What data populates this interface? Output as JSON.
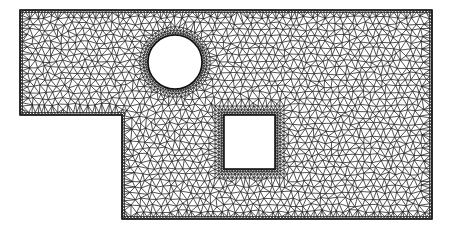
{
  "figure": {
    "type": "triangular finite element mesh",
    "width": 450,
    "height": 231,
    "colors": {
      "background": "#ffffff",
      "mesh_line": "#1a1a1a",
      "domain_fill": "#ffffff",
      "hole_fill": "#ffffff"
    },
    "domain": {
      "outline": [
        [
          20,
          10
        ],
        [
          432,
          10
        ],
        [
          432,
          219
        ],
        [
          122,
          219
        ],
        [
          122,
          115
        ],
        [
          20,
          115
        ]
      ]
    },
    "holes": [
      {
        "kind": "circle",
        "cx": 175,
        "cy": 62,
        "r": 27
      },
      {
        "kind": "square",
        "x": 224,
        "y": 115,
        "w": 51,
        "h": 54
      }
    ],
    "mesh": {
      "base_spacing": 7.2,
      "boundary_refinement": true,
      "seed": 7
    }
  }
}
